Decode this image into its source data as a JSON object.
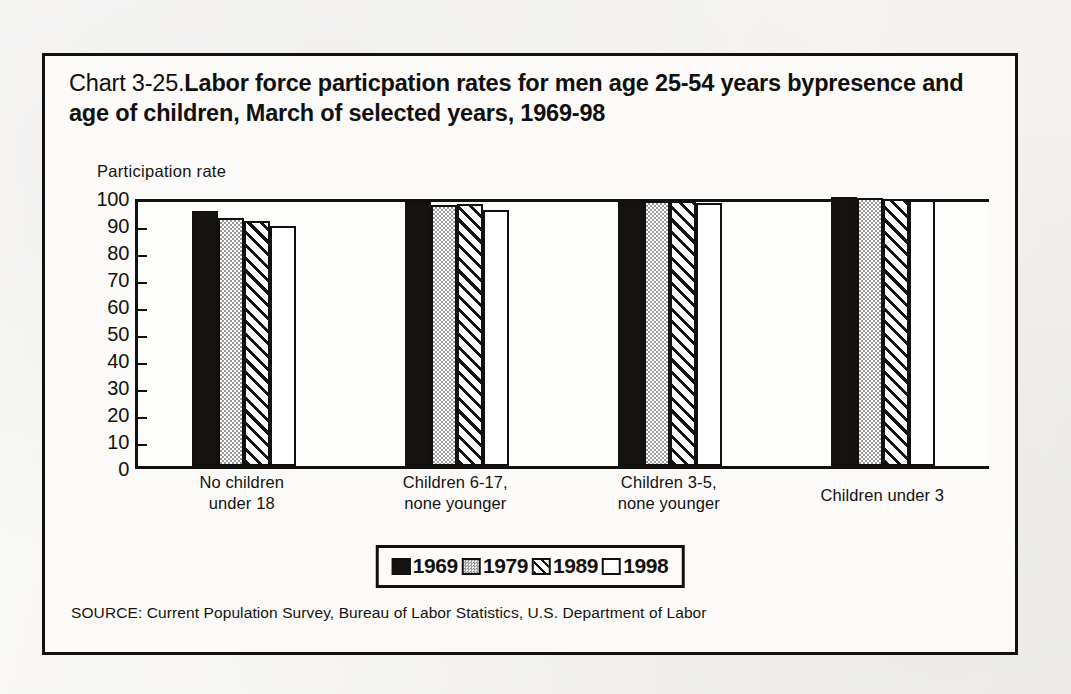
{
  "figure": {
    "chart_number": "Chart 3-25.",
    "title": "Labor force particpation rates for men age 25-54 years bypresence and age of children, March of selected years, 1969-98",
    "source": "SOURCE: Current Population Survey, Bureau of Labor Statistics, U.S. Department of Labor"
  },
  "chart_data": {
    "type": "bar",
    "title": "Chart 3-25.Labor force particpation rates for men age 25-54 years bypresence and age of children, March of selected years, 1969-98",
    "xlabel": "",
    "ylabel": "Participation rate",
    "ylim": [
      0,
      100
    ],
    "yticks": [
      0,
      10,
      20,
      30,
      40,
      50,
      60,
      70,
      80,
      90,
      100
    ],
    "ytick_labels": [
      "0",
      "10",
      "20",
      "30",
      "40",
      "50",
      "60",
      "70",
      "80",
      "90",
      "100"
    ],
    "grid": false,
    "legend_position": "bottom-center",
    "categories": [
      "No children under 18",
      "Children 6-17, none younger",
      "Children 3-5, none younger",
      "Children under 3"
    ],
    "category_lines": [
      [
        "No children",
        "under 18"
      ],
      [
        "Children 6-17,",
        "none younger"
      ],
      [
        "Children 3-5,",
        "none younger"
      ],
      [
        "Children under 3"
      ]
    ],
    "series": [
      {
        "name": "1969",
        "fill": "solid-black",
        "color": "#15120f",
        "values": [
          94.3,
          98.0,
          99.0,
          99.6
        ]
      },
      {
        "name": "1979",
        "fill": "gray-dither",
        "color": "#a8a8a8",
        "values": [
          91.8,
          96.5,
          98.3,
          99.1
        ]
      },
      {
        "name": "1989",
        "fill": "diagonal-hatch",
        "color": "#ffffff",
        "values": [
          90.9,
          97.0,
          98.2,
          98.8
        ]
      },
      {
        "name": "1998",
        "fill": "open-white",
        "color": "#ffffff",
        "values": [
          89.0,
          95.0,
          97.3,
          98.4
        ]
      }
    ]
  },
  "legend": {
    "entries": [
      {
        "label": "1969",
        "swatch": "solid-black-swatch"
      },
      {
        "label": "1979",
        "swatch": "gray-dither-swatch"
      },
      {
        "label": "1989",
        "swatch": "diagonal-hatch-swatch"
      },
      {
        "label": "1998",
        "swatch": "open-white-swatch"
      }
    ]
  },
  "colors": {
    "ink": "#13110f",
    "page": "#f4f3f1",
    "panel": "#fbfaf8",
    "series_1969": "#15120f",
    "series_1979": "#a8a8a8",
    "series_1989": "#ffffff",
    "series_1998": "#ffffff"
  }
}
